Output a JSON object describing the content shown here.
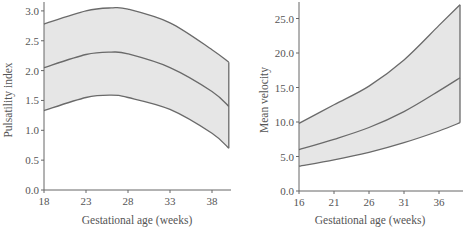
{
  "chart_data": [
    {
      "type": "area",
      "title": "",
      "xlabel": "Gestational age (weeks)",
      "ylabel": "Pulsatility index",
      "xlim": [
        18,
        40
      ],
      "ylim": [
        0.0,
        3.0
      ],
      "xticks": [
        "18",
        "23",
        "28",
        "33",
        "38"
      ],
      "yticks": [
        "0.0",
        "0.5",
        "1.0",
        "1.5",
        "2.0",
        "2.5",
        "3.0"
      ],
      "grid": false,
      "x": [
        18,
        23,
        26,
        28,
        33,
        38,
        40
      ],
      "series": [
        {
          "name": "upper",
          "values": [
            2.78,
            3.0,
            3.05,
            3.03,
            2.8,
            2.35,
            2.14
          ]
        },
        {
          "name": "mean",
          "values": [
            2.05,
            2.27,
            2.31,
            2.28,
            2.05,
            1.65,
            1.4
          ]
        },
        {
          "name": "lower",
          "values": [
            1.33,
            1.55,
            1.59,
            1.55,
            1.35,
            0.95,
            0.7
          ]
        }
      ]
    },
    {
      "type": "area",
      "title": "",
      "xlabel": "Gestational age (weeks)",
      "ylabel": "Mean velocity",
      "xlim": [
        16,
        39
      ],
      "ylim": [
        0.0,
        27.0
      ],
      "xticks": [
        "16",
        "21",
        "26",
        "31",
        "36"
      ],
      "yticks": [
        "0.0",
        "5.0",
        "10.0",
        "15.0",
        "20.0",
        "25.0"
      ],
      "grid": false,
      "x": [
        16,
        21,
        26,
        31,
        36,
        39
      ],
      "series": [
        {
          "name": "upper",
          "values": [
            9.8,
            12.5,
            15.2,
            19.0,
            24.0,
            27.0
          ]
        },
        {
          "name": "mean",
          "values": [
            6.0,
            7.5,
            9.2,
            11.5,
            14.5,
            16.4
          ]
        },
        {
          "name": "lower",
          "values": [
            3.6,
            4.5,
            5.6,
            7.0,
            8.7,
            9.9
          ]
        }
      ]
    }
  ],
  "colors": {
    "band": "#e6e6e6",
    "curve": "#6a6a6a",
    "axis": "#666666",
    "text": "#555555"
  }
}
